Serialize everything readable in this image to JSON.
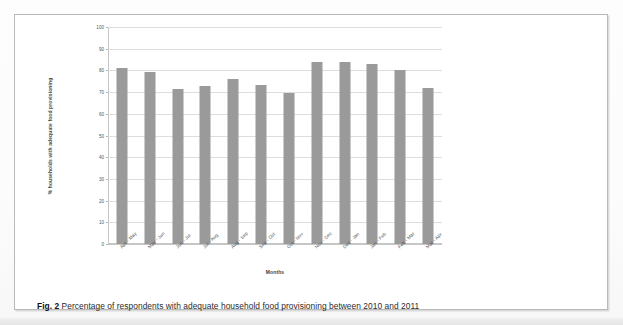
{
  "figure": {
    "caption_label": "Fig. 2",
    "caption_text": "Percentage of respondents with adequate household food provisioning between 2010 and 2011"
  },
  "chart_data": {
    "type": "bar",
    "title": "",
    "xlabel": "Months",
    "ylabel": "% households with adequate food provisioning",
    "categories": [
      "Apr - May",
      "May - Jun",
      "Jun - Jul",
      "Jul - Aug",
      "Aug - Sep",
      "Sep - Oct",
      "Oct - Nov",
      "Nov - Dec",
      "Dec - Jan",
      "Jan - Feb",
      "Feb - Mar",
      "Mar - Apr"
    ],
    "values": [
      81,
      79.5,
      71.5,
      73,
      76,
      73.5,
      69.5,
      84,
      84,
      83,
      80,
      72
    ],
    "ylim": [
      0,
      100
    ],
    "yticks": [
      0,
      10,
      20,
      30,
      40,
      50,
      60,
      70,
      80,
      90,
      100
    ],
    "ytick_labels": [
      "0",
      "10",
      "20",
      "30",
      "40",
      "50",
      "60",
      "70",
      "80",
      "90",
      "100"
    ],
    "grid": true,
    "legend": false,
    "bar_color": "#9a9a9a",
    "grid_color": "#dddddd",
    "axis_color": "#c6c6c6"
  }
}
